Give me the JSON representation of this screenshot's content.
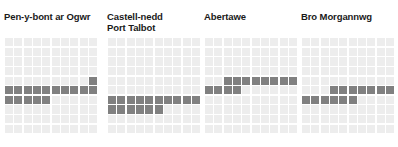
{
  "figure": {
    "background_color": "#ffffff",
    "title_color": "#1a1a1a",
    "empty_cell_color": "#ededed",
    "filled_cell_color": "#808080",
    "dark_cell_color": "#6e6e6e"
  },
  "panels": [
    {
      "id": "pen-y-bont-ar-ogwr",
      "title": "Pen-y-bont ar Ogwr",
      "title_lines": [
        "Pen-y-bont ar Ogwr"
      ]
    },
    {
      "id": "castell-nedd-port-talbot",
      "title": "Castell-nedd\nPort Talbot",
      "title_lines": [
        "Castell-nedd",
        "Port Talbot"
      ]
    },
    {
      "id": "abertawe",
      "title": "Abertawe",
      "title_lines": [
        "Abertawe"
      ]
    },
    {
      "id": "bro-morgannwg",
      "title": "Bro Morgannwg",
      "title_lines": [
        "Bro Morgannwg"
      ]
    }
  ],
  "chart_data": {
    "type": "heatmap",
    "chart_subtype": "waffle-grid small-multiples",
    "title": "",
    "xlabel": "",
    "ylabel": "",
    "grid_rows": 10,
    "grid_cols": 10,
    "cell_total": 100,
    "legend": [],
    "series": [
      {
        "name": "Pen-y-bont ar Ogwr",
        "value": 16,
        "filled_cells": [
          {
            "row": 4,
            "col": 9
          },
          {
            "row": 5,
            "col": 0
          },
          {
            "row": 5,
            "col": 1
          },
          {
            "row": 5,
            "col": 2
          },
          {
            "row": 5,
            "col": 3
          },
          {
            "row": 5,
            "col": 4
          },
          {
            "row": 5,
            "col": 5
          },
          {
            "row": 5,
            "col": 6
          },
          {
            "row": 5,
            "col": 7
          },
          {
            "row": 5,
            "col": 8
          },
          {
            "row": 5,
            "col": 9
          },
          {
            "row": 6,
            "col": 0
          },
          {
            "row": 6,
            "col": 1
          },
          {
            "row": 6,
            "col": 2
          },
          {
            "row": 6,
            "col": 3
          },
          {
            "row": 6,
            "col": 4
          }
        ]
      },
      {
        "name": "Castell-nedd Port Talbot",
        "value": 16,
        "filled_cells": [
          {
            "row": 6,
            "col": 0
          },
          {
            "row": 6,
            "col": 1
          },
          {
            "row": 6,
            "col": 2
          },
          {
            "row": 6,
            "col": 3
          },
          {
            "row": 6,
            "col": 4
          },
          {
            "row": 6,
            "col": 5
          },
          {
            "row": 6,
            "col": 6
          },
          {
            "row": 6,
            "col": 7
          },
          {
            "row": 6,
            "col": 8
          },
          {
            "row": 6,
            "col": 9
          },
          {
            "row": 7,
            "col": 0
          },
          {
            "row": 7,
            "col": 1
          },
          {
            "row": 7,
            "col": 2
          },
          {
            "row": 7,
            "col": 3
          },
          {
            "row": 7,
            "col": 4
          },
          {
            "row": 7,
            "col": 5
          }
        ]
      },
      {
        "name": "Abertawe",
        "value": 12,
        "filled_cells": [
          {
            "row": 4,
            "col": 2
          },
          {
            "row": 4,
            "col": 3
          },
          {
            "row": 4,
            "col": 4
          },
          {
            "row": 4,
            "col": 5
          },
          {
            "row": 4,
            "col": 6
          },
          {
            "row": 4,
            "col": 7
          },
          {
            "row": 4,
            "col": 8
          },
          {
            "row": 4,
            "col": 9
          },
          {
            "row": 5,
            "col": 0
          },
          {
            "row": 5,
            "col": 1
          },
          {
            "row": 5,
            "col": 2
          },
          {
            "row": 5,
            "col": 3
          }
        ]
      },
      {
        "name": "Bro Morgannwg",
        "value": 13,
        "filled_cells": [
          {
            "row": 5,
            "col": 3
          },
          {
            "row": 5,
            "col": 4
          },
          {
            "row": 5,
            "col": 5
          },
          {
            "row": 5,
            "col": 6
          },
          {
            "row": 5,
            "col": 7
          },
          {
            "row": 5,
            "col": 8
          },
          {
            "row": 5,
            "col": 9
          },
          {
            "row": 6,
            "col": 0
          },
          {
            "row": 6,
            "col": 1
          },
          {
            "row": 6,
            "col": 2
          },
          {
            "row": 6,
            "col": 3
          },
          {
            "row": 6,
            "col": 4
          },
          {
            "row": 6,
            "col": 5
          }
        ]
      }
    ]
  }
}
